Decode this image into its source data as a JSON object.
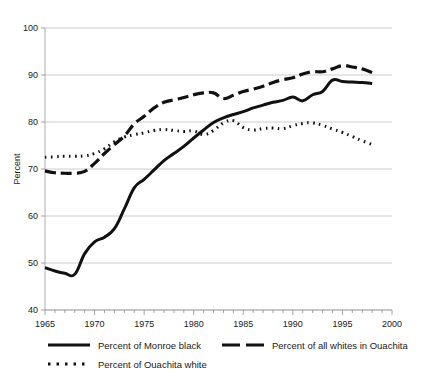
{
  "chart_data": {
    "type": "line",
    "title": "",
    "xlabel": "",
    "ylabel": "Percent",
    "xlim": [
      1965,
      2000
    ],
    "ylim": [
      40,
      100
    ],
    "ytick_labels": [
      "100",
      "90",
      "80",
      "70",
      "60",
      "50",
      "40"
    ],
    "ytick_values": [
      100,
      90,
      80,
      70,
      60,
      50,
      40
    ],
    "xtick_labels": [
      "1965",
      "1970",
      "1975",
      "1980",
      "1985",
      "1990",
      "1995",
      "2000"
    ],
    "xtick_values": [
      1965,
      1970,
      1975,
      1980,
      1985,
      1990,
      1995,
      2000
    ],
    "minor_x_tick_step": 1,
    "grid": "horizontal",
    "legend_position": "below-axes",
    "x": [
      1965,
      1966,
      1967,
      1968,
      1969,
      1970,
      1971,
      1972,
      1973,
      1974,
      1975,
      1976,
      1977,
      1978,
      1979,
      1980,
      1981,
      1982,
      1983,
      1984,
      1985,
      1986,
      1987,
      1988,
      1989,
      1990,
      1991,
      1992,
      1993,
      1994,
      1995,
      1996,
      1997,
      1998
    ],
    "series": [
      {
        "name": "Percent of Monroe black",
        "style": "solid",
        "color": "#111111",
        "values": [
          49.0,
          48.3,
          47.8,
          47.6,
          52.0,
          54.5,
          55.5,
          57.3,
          61.5,
          66.0,
          67.8,
          69.8,
          71.8,
          73.3,
          74.8,
          76.6,
          78.3,
          79.9,
          80.9,
          81.6,
          82.2,
          83.0,
          83.6,
          84.2,
          84.6,
          85.3,
          84.5,
          85.8,
          86.5,
          88.9,
          88.6,
          88.5,
          88.4,
          88.2
        ]
      },
      {
        "name": "Percent of all whites in Ouachita",
        "style": "dashed",
        "color": "#111111",
        "values": [
          69.6,
          69.2,
          69.1,
          69.1,
          69.5,
          71.2,
          73.3,
          75.2,
          77.0,
          79.6,
          81.2,
          83.0,
          84.2,
          84.7,
          85.2,
          85.8,
          86.2,
          86.2,
          85.0,
          85.7,
          86.5,
          87.0,
          87.6,
          88.4,
          89.0,
          89.4,
          90.2,
          90.7,
          90.7,
          91.3,
          92.0,
          91.7,
          91.3,
          90.5
        ]
      },
      {
        "name": "Percent of Ouachita white",
        "style": "dotted",
        "color": "#111111",
        "values": [
          72.5,
          72.6,
          72.7,
          72.7,
          72.8,
          73.3,
          74.3,
          75.8,
          76.8,
          77.3,
          77.7,
          78.2,
          78.4,
          78.2,
          78.0,
          78.1,
          77.3,
          78.2,
          79.8,
          80.3,
          78.8,
          78.3,
          78.6,
          78.7,
          78.6,
          79.2,
          79.7,
          79.8,
          79.5,
          78.8,
          78.0,
          77.9,
          78.3,
          78.8
        ]
      }
    ],
    "dotted_tail": {
      "note": "Ouachita white declines after 1993",
      "x": [
        1993,
        1994,
        1995,
        1996,
        1997,
        1998
      ],
      "values": [
        79.3,
        78.5,
        77.8,
        76.9,
        76.0,
        75.2
      ]
    }
  },
  "axes": {
    "y_title": "Percent"
  },
  "legend": {
    "entries": [
      {
        "label": "Percent of Monroe black",
        "style": "solid"
      },
      {
        "label": "Percent of all whites in Ouachita",
        "style": "dashed"
      },
      {
        "label": "Percent of Ouachita white",
        "style": "dotted"
      }
    ]
  }
}
